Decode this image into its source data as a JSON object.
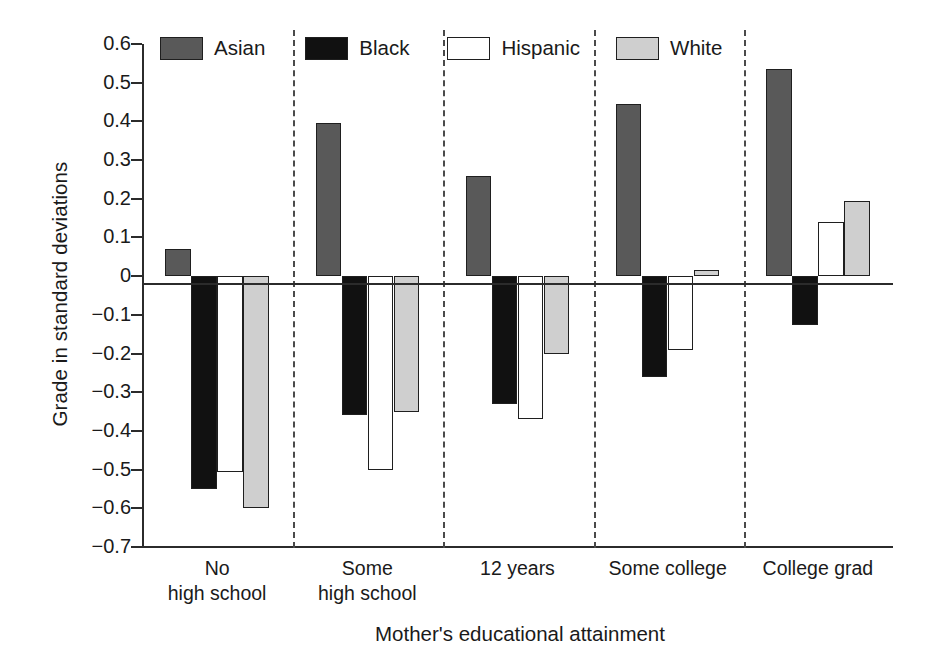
{
  "chart_data": {
    "type": "bar",
    "title": "",
    "xlabel": "Mother's educational attainment",
    "ylabel": "Grade in standard deviations",
    "ylim": [
      -0.7,
      0.6
    ],
    "ytick_labels": [
      "0.6",
      "0.5",
      "0.4",
      "0.3",
      "0.2",
      "0.1",
      "0",
      "−0.1",
      "−0.2",
      "−0.3",
      "−0.4",
      "−0.5",
      "−0.6",
      "−0.7"
    ],
    "ytick_values": [
      0.6,
      0.5,
      0.4,
      0.3,
      0.2,
      0.1,
      0,
      -0.1,
      -0.2,
      -0.3,
      -0.4,
      -0.5,
      -0.6,
      -0.7
    ],
    "grid": false,
    "legend_position": "top",
    "categories": [
      "No high school",
      "Some high school",
      "12 years",
      "Some college",
      "College grad"
    ],
    "category_lines": [
      [
        "No",
        "high school"
      ],
      [
        "Some",
        "high school"
      ],
      [
        "12 years",
        ""
      ],
      [
        "Some college",
        ""
      ],
      [
        "College grad",
        ""
      ]
    ],
    "series": [
      {
        "name": "Asian",
        "color": "#595959",
        "values": [
          0.07,
          0.395,
          0.26,
          0.445,
          0.535
        ]
      },
      {
        "name": "Black",
        "color": "#111111",
        "values": [
          -0.55,
          -0.36,
          -0.33,
          -0.26,
          -0.125
        ]
      },
      {
        "name": "Hispanic",
        "color": "#ffffff",
        "values": [
          -0.505,
          -0.5,
          -0.37,
          -0.19,
          0.14
        ]
      },
      {
        "name": "White",
        "color": "#cfcfcf",
        "values": [
          -0.6,
          -0.35,
          -0.2,
          0.015,
          0.195
        ]
      }
    ]
  },
  "axes": {
    "ylabel": "Grade in standard deviations",
    "xlabel": "Mother's educational attainment"
  },
  "legend": {
    "items": [
      {
        "label": "Asian"
      },
      {
        "label": "Black"
      },
      {
        "label": "Hispanic"
      },
      {
        "label": "White"
      }
    ]
  }
}
